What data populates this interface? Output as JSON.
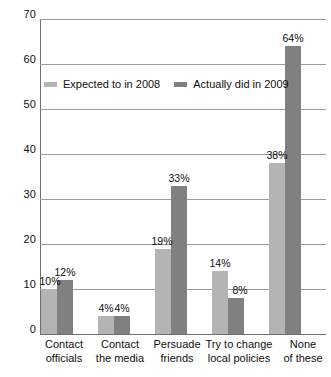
{
  "chart_data": {
    "type": "bar",
    "title": "",
    "subtitle": "",
    "xlabel": "",
    "ylabel": "",
    "ylim": [
      0,
      70
    ],
    "ytick_step": 10,
    "yticks": [
      "70",
      "60",
      "50",
      "40",
      "30",
      "20",
      "10",
      "0"
    ],
    "grid": true,
    "legend_position": "inside-top-left",
    "categories": [
      "Contact officials",
      "Contact the media",
      "Persuade friends",
      "Try to change local policies",
      "None of these"
    ],
    "category_lines": [
      [
        "Contact",
        "officials"
      ],
      [
        "Contact",
        "the media"
      ],
      [
        "Persuade",
        "friends"
      ],
      [
        "Try to change",
        "local policies"
      ],
      [
        "None",
        "of these"
      ]
    ],
    "series": [
      {
        "name": "Expected to in 2008",
        "color": "#b4b4b4",
        "values": [
          10,
          4,
          19,
          14,
          38
        ],
        "labels": [
          "10%",
          "4%",
          "19%",
          "14%",
          "38%"
        ]
      },
      {
        "name": "Actually did in 2009",
        "color": "#808080",
        "values": [
          12,
          4,
          33,
          8,
          64
        ],
        "labels": [
          "12%",
          "4%",
          "33%",
          "8%",
          "64%"
        ]
      }
    ]
  },
  "legend": {
    "entries": [
      {
        "label": "Expected to in 2008",
        "swatch": "legend-swatch-expected"
      },
      {
        "label": "Actually did in 2009",
        "swatch": "legend-swatch-actual"
      }
    ]
  },
  "colors": {
    "expected": "#b4b4b4",
    "actual": "#808080",
    "gridline": "#9a9a9a",
    "axis": "#6e6e6e",
    "background": "#ffffff",
    "text": "#0f0f0f"
  }
}
